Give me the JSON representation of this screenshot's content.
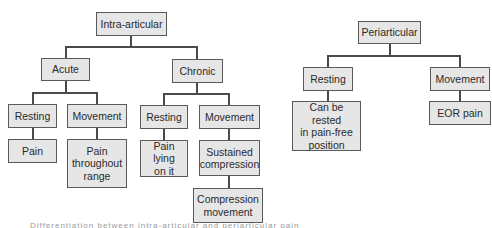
{
  "diagram": {
    "type": "tree",
    "left_tree": {
      "root": "Intra-articular",
      "acute": {
        "label": "Acute",
        "resting": {
          "label": "Resting",
          "child": "Pain"
        },
        "movement": {
          "label": "Movement",
          "child": "Pain\nthroughout\nrange"
        }
      },
      "chronic": {
        "label": "Chronic",
        "resting": {
          "label": "Resting",
          "child": "Pain lying\non it"
        },
        "movement": {
          "label": "Movement",
          "child": "Sustained\ncompression",
          "grandchild": "Compression\nmovement"
        }
      }
    },
    "right_tree": {
      "root": "Periarticular",
      "resting": {
        "label": "Resting",
        "child": "Can be rested\nin pain-free\nposition"
      },
      "movement": {
        "label": "Movement",
        "child": "EOR pain"
      }
    },
    "caption": "Differentiation between intra-articular and periarticular pain"
  }
}
